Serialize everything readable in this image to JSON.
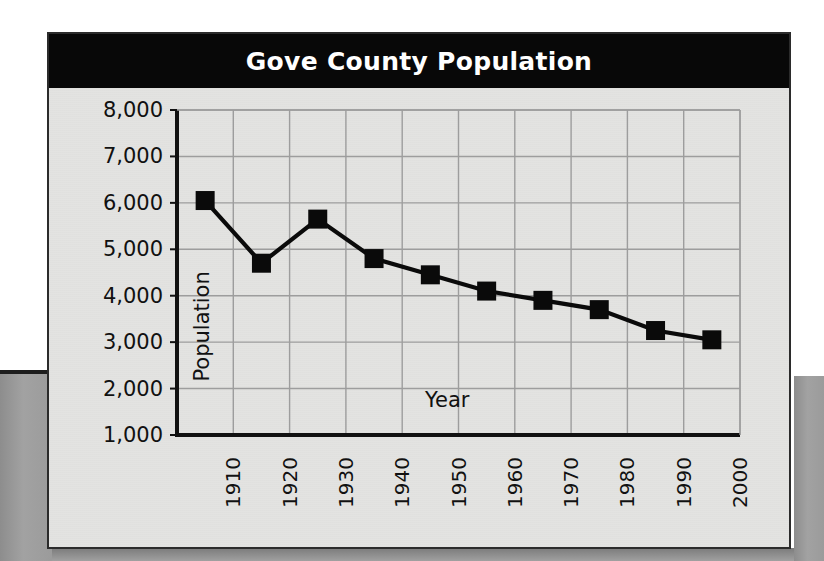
{
  "card": {
    "title": "Gove County Population"
  },
  "chart_data": {
    "type": "line",
    "title": "Gove County Population",
    "xlabel": "Year",
    "ylabel": "Population",
    "x": [
      1905,
      1915,
      1925,
      1935,
      1945,
      1955,
      1965,
      1975,
      1985,
      1995
    ],
    "values": [
      6050,
      4700,
      5650,
      4800,
      4450,
      4100,
      3900,
      3700,
      3250,
      3050
    ],
    "series": [
      {
        "name": "Population",
        "values": [
          6050,
          4700,
          5650,
          4800,
          4450,
          4100,
          3900,
          3700,
          3250,
          3050
        ]
      }
    ],
    "xlim": [
      1900,
      2000
    ],
    "ylim": [
      1000,
      8000
    ],
    "x_tick_labels": [
      "1910",
      "1920",
      "1930",
      "1940",
      "1950",
      "1960",
      "1970",
      "1980",
      "1990",
      "2000"
    ],
    "x_tick_values": [
      1910,
      1920,
      1930,
      1940,
      1950,
      1960,
      1970,
      1980,
      1990,
      2000
    ],
    "y_tick_labels": [
      "8,000",
      "7,000",
      "6,000",
      "5,000",
      "4,000",
      "3,000",
      "2,000",
      "1,000"
    ],
    "y_tick_values": [
      8000,
      7000,
      6000,
      5000,
      4000,
      3000,
      2000,
      1000
    ],
    "grid": true,
    "legend": null,
    "marker": "square",
    "colors": {
      "line": "#0a0a0a",
      "marker": "#0a0a0a",
      "grid": "#9d9d9d",
      "axis": "#111111",
      "plot_background": "#e3e3e1",
      "title_background": "#080808",
      "title_text": "#ffffff"
    }
  }
}
